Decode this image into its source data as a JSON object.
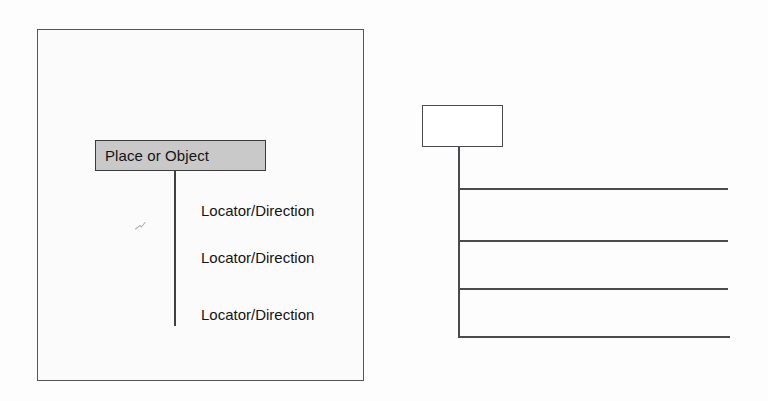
{
  "document": {
    "kind": "scanned-figure",
    "background_color": "#fdfdfd"
  },
  "diagram_left": {
    "name": "labeled-tree-diagram",
    "frame": {
      "border_color": "#55565a",
      "fill_color": "#fbfbfb"
    },
    "root": {
      "label": "Place or Object",
      "fill_color": "#c9c9c9",
      "border_color": "#3a3b3d"
    },
    "branches": [
      {
        "label": "Locator/Direction"
      },
      {
        "label": "Locator/Direction"
      },
      {
        "label": "Locator/Direction"
      }
    ],
    "line_color": "#3f4042"
  },
  "diagram_right": {
    "name": "blank-tree-template",
    "root": {
      "label": "",
      "fill_color": "#ffffff",
      "border_color": "#4a4b4e"
    },
    "branches": [
      {
        "label": ""
      },
      {
        "label": ""
      },
      {
        "label": ""
      },
      {
        "label": ""
      }
    ],
    "line_color": "#4a4b4e"
  }
}
